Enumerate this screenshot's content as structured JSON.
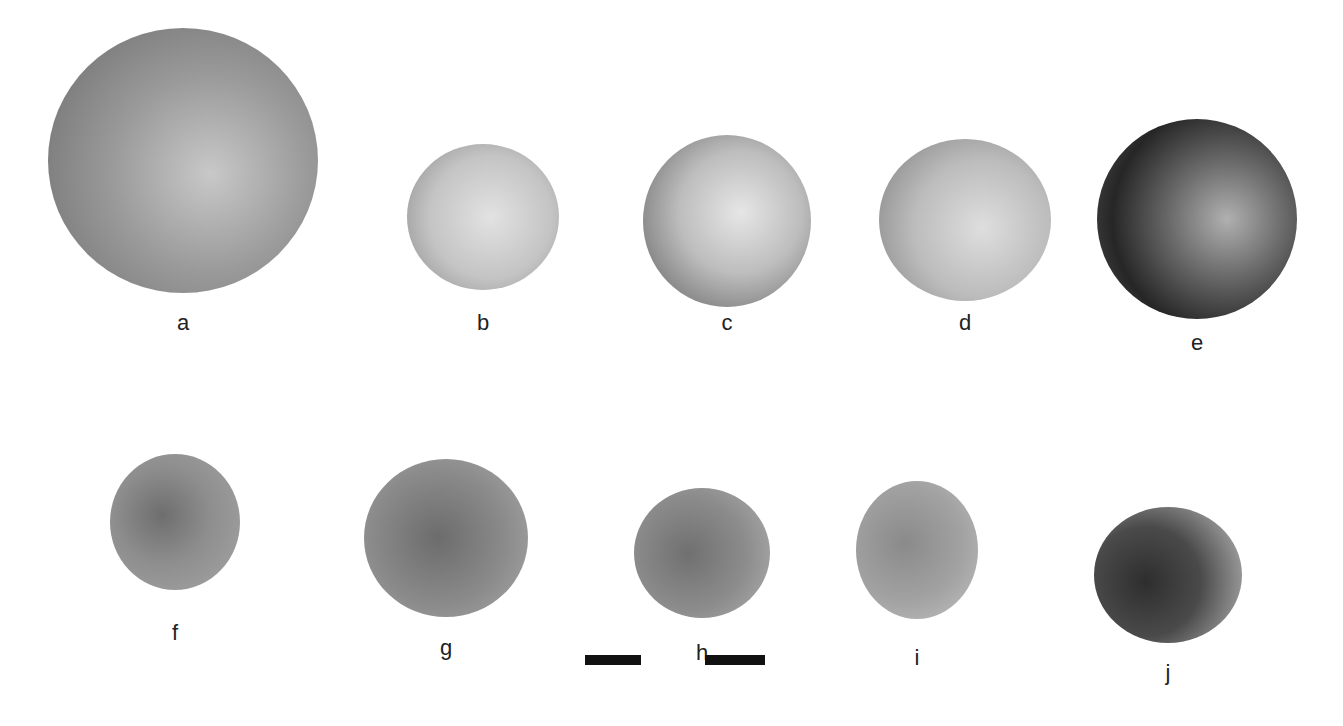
{
  "figure": {
    "specimens": [
      {
        "label": "a",
        "cx": 183,
        "cy": 160,
        "w": 270,
        "h": 265,
        "fill": "radial-gradient(circle at 60% 55%, #c8c8c8 0%, #9a9a9a 45%, #7c7c7c 80%, #a8a8a8 100%)",
        "label_y": 310
      },
      {
        "label": "b",
        "cx": 483,
        "cy": 217,
        "w": 152,
        "h": 146,
        "fill": "radial-gradient(circle at 55% 50%, #e2e2e2 0%, #c4c4c4 55%, #8a8a8a 100%)",
        "label_y": 310
      },
      {
        "label": "c",
        "cx": 727,
        "cy": 221,
        "w": 168,
        "h": 172,
        "fill": "radial-gradient(circle at 58% 45%, #e6e6e6 0%, #bdbdbd 45%, #6e6e6e 90%, #9c9c9c 100%)",
        "label_y": 310
      },
      {
        "label": "d",
        "cx": 965,
        "cy": 220,
        "w": 172,
        "h": 162,
        "fill": "radial-gradient(circle at 60% 55%, #dedede 0%, #bcbcbc 50%, #7e7e7e 100%)",
        "label_y": 310
      },
      {
        "label": "e",
        "cx": 1197,
        "cy": 219,
        "w": 200,
        "h": 200,
        "fill": "radial-gradient(circle at 65% 50%, #b0b0b0 0%, #6a6a6a 35%, #262626 70%, #555 100%)",
        "label_y": 330
      },
      {
        "label": "f",
        "cx": 175,
        "cy": 522,
        "w": 130,
        "h": 136,
        "fill": "radial-gradient(circle at 40% 45%, #6e6e6e 0%, #8e8e8e 45%, #a6a6a6 100%)",
        "label_y": 620
      },
      {
        "label": "g",
        "cx": 446,
        "cy": 538,
        "w": 164,
        "h": 158,
        "fill": "radial-gradient(circle at 45% 50%, #6c6c6c 0%, #8a8a8a 55%, #a9a9a9 100%)",
        "label_y": 635
      },
      {
        "label": "h",
        "cx": 702,
        "cy": 553,
        "w": 136,
        "h": 130,
        "fill": "radial-gradient(circle at 40% 50%, #707070 0%, #8c8c8c 55%, #b0b0b0 100%)",
        "label_y": 640
      },
      {
        "label": "i",
        "cx": 917,
        "cy": 550,
        "w": 122,
        "h": 138,
        "fill": "radial-gradient(circle at 40% 45%, #8a8a8a 0%, #a2a2a2 55%, #c2c2c2 100%)",
        "label_y": 645
      },
      {
        "label": "j",
        "cx": 1168,
        "cy": 575,
        "w": 148,
        "h": 136,
        "fill": "radial-gradient(circle at 35% 55%, #2e2e2e 0%, #4a4a4a 45%, #8c8c8c 75%, #c4c4c4 100%)",
        "label_y": 660
      }
    ],
    "scale_bars": [
      {
        "x": 585,
        "y": 655,
        "w": 56,
        "h": 10
      },
      {
        "x": 705,
        "y": 655,
        "w": 60,
        "h": 10
      }
    ]
  }
}
